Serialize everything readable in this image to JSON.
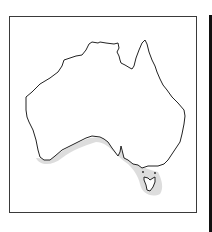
{
  "map": {
    "region": "Australia",
    "highlighted_area": "southern coastal waters and Tasmania",
    "colors": {
      "outline": "#222222",
      "range_shade": "#d9d9d9",
      "frame": "#3a3a3a",
      "side_rule": "#111111"
    }
  }
}
